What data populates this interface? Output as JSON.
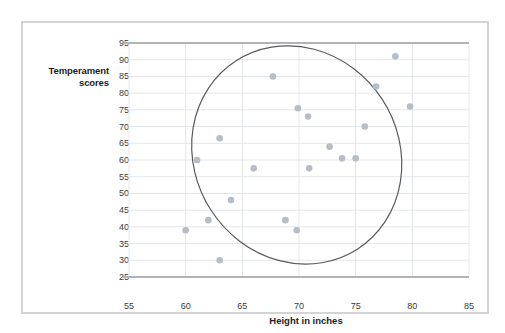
{
  "chart_data": {
    "type": "scatter",
    "title": "",
    "xlabel": "Height in inches",
    "ylabel": "Temperament scores",
    "xlim": [
      55,
      85
    ],
    "ylim": [
      25,
      95
    ],
    "xticks": [
      55,
      60,
      65,
      70,
      75,
      80,
      85
    ],
    "yticks": [
      25,
      30,
      35,
      40,
      45,
      50,
      55,
      60,
      65,
      70,
      75,
      80,
      85,
      90,
      95
    ],
    "grid": true,
    "legend": null,
    "point_color": "#b7bdc4",
    "grid_color": "#e3e7ea",
    "axis_color": "#b0b4b8",
    "ellipse_color": "#5a5a5a",
    "x": [
      60.0,
      61.0,
      62.0,
      63.0,
      63.0,
      64.0,
      66.0,
      67.7,
      68.8,
      69.8,
      69.9,
      70.8,
      70.9,
      72.7,
      73.8,
      75.0,
      75.8,
      76.8,
      78.5,
      79.8
    ],
    "y": [
      39.0,
      60.0,
      42.0,
      66.5,
      30.0,
      48.0,
      57.5,
      85.0,
      42.0,
      39.0,
      75.5,
      73.0,
      57.5,
      64.0,
      60.5,
      60.5,
      70.0,
      82.0,
      91.0,
      76.0
    ],
    "points": [
      {
        "x": 60.0,
        "y": 39.0
      },
      {
        "x": 61.0,
        "y": 60.0
      },
      {
        "x": 62.0,
        "y": 42.0
      },
      {
        "x": 63.0,
        "y": 66.5
      },
      {
        "x": 63.0,
        "y": 30.0
      },
      {
        "x": 64.0,
        "y": 48.0
      },
      {
        "x": 66.0,
        "y": 57.5
      },
      {
        "x": 67.7,
        "y": 85.0
      },
      {
        "x": 68.8,
        "y": 42.0
      },
      {
        "x": 69.8,
        "y": 39.0
      },
      {
        "x": 69.9,
        "y": 75.5
      },
      {
        "x": 70.8,
        "y": 73.0
      },
      {
        "x": 70.9,
        "y": 57.5
      },
      {
        "x": 72.7,
        "y": 64.0
      },
      {
        "x": 73.8,
        "y": 60.5
      },
      {
        "x": 75.0,
        "y": 60.5
      },
      {
        "x": 75.8,
        "y": 70.0
      },
      {
        "x": 76.8,
        "y": 82.0
      },
      {
        "x": 78.5,
        "y": 91.0
      },
      {
        "x": 79.8,
        "y": 76.0
      }
    ],
    "annotations": [
      {
        "type": "ellipse",
        "name": "correlation-ellipse",
        "center_x": 69.8,
        "center_y": 61.5,
        "width": 18.0,
        "height": 67.0,
        "rotation_deg": -33
      }
    ]
  },
  "axis": {
    "y_title_line1": "Temperament",
    "y_title_line2": "scores",
    "x_title": "Height in inches"
  }
}
